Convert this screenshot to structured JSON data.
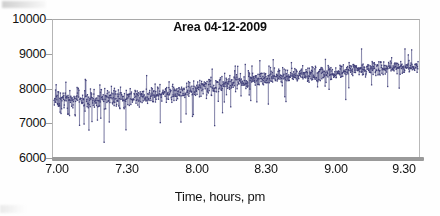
{
  "chart_data": {
    "type": "line",
    "title": "Area 04-12-2009",
    "xlabel": "Time, hours, pm",
    "ylabel": "",
    "xlim": [
      7.0,
      9.68
    ],
    "ylim": [
      6000,
      10000
    ],
    "ytick_labels": [
      "10000",
      "9000",
      "8000",
      "7000",
      "6000"
    ],
    "ytick_values": [
      10000,
      9000,
      8000,
      7000,
      6000
    ],
    "xtick_labels": [
      "7.00",
      "7.30",
      "8.00",
      "8.30",
      "9.00",
      "9.30"
    ],
    "xtick_values": [
      7.0,
      7.3,
      8.0,
      8.3,
      9.0,
      9.3
    ],
    "grid": false,
    "legend": "none",
    "series": [
      {
        "name": "Area",
        "color": "#3e3d78",
        "marker": "dot",
        "description": "Dense noisy time series of area counts sampled at high frequency, rising trend with large scatter",
        "trend_points": [
          {
            "x": 7.0,
            "y": 7700
          },
          {
            "x": 7.1,
            "y": 7700
          },
          {
            "x": 7.2,
            "y": 7680
          },
          {
            "x": 7.3,
            "y": 7700
          },
          {
            "x": 7.4,
            "y": 7720
          },
          {
            "x": 7.5,
            "y": 7750
          },
          {
            "x": 8.0,
            "y": 7950
          },
          {
            "x": 8.1,
            "y": 8050
          },
          {
            "x": 8.2,
            "y": 8100
          },
          {
            "x": 8.3,
            "y": 8150
          },
          {
            "x": 8.4,
            "y": 8250
          },
          {
            "x": 8.5,
            "y": 8350
          },
          {
            "x": 9.0,
            "y": 8450
          },
          {
            "x": 9.1,
            "y": 8500
          },
          {
            "x": 9.2,
            "y": 8550
          },
          {
            "x": 9.3,
            "y": 8580
          },
          {
            "x": 9.4,
            "y": 8600
          },
          {
            "x": 9.68,
            "y": 8620
          }
        ],
        "noise_band": {
          "upper_start": 8600,
          "lower_start": 6500,
          "upper_end": 9100,
          "lower_end": 8050,
          "spike_down_min": 6450,
          "spike_up_max": 9150
        },
        "n_points": 1200
      }
    ]
  },
  "axes": {
    "y_axis_name": "area-axis",
    "x_axis_name": "time-axis",
    "baseline_color": "#9a9a9a",
    "frame_color": "#a9a9a9"
  }
}
